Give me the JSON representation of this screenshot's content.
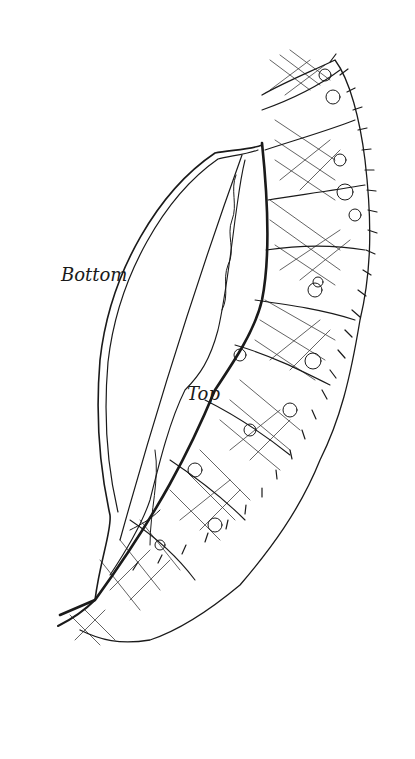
{
  "figure": {
    "labels": {
      "bottom": "Bottom",
      "top": "Top"
    },
    "colors": {
      "ink": "#1a1a1a",
      "background": "#ffffff"
    }
  }
}
